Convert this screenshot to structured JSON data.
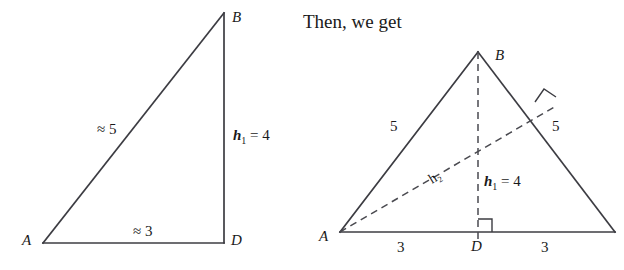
{
  "canvas": {
    "width": 624,
    "height": 270,
    "background": "#ffffff"
  },
  "colors": {
    "stroke": "#3c3c42",
    "dashed_stroke": "#4a4a50",
    "text": "#1a1a1a"
  },
  "prose": {
    "connector_text": "Then, we get"
  },
  "left_figure": {
    "name": "right-triangle-ABD",
    "vertices": {
      "A": {
        "label": "A",
        "x": 43,
        "y": 243
      },
      "B": {
        "label": "B",
        "x": 224,
        "y": 13
      },
      "D": {
        "label": "D",
        "x": 224,
        "y": 243
      }
    },
    "vertex_labels": {
      "A": {
        "text": "A",
        "x": 22,
        "y": 245
      },
      "B": {
        "text": "B",
        "x": 232,
        "y": 22
      },
      "D": {
        "text": "D",
        "x": 231,
        "y": 245
      }
    },
    "side_labels": [
      {
        "name": "hypotenuse-label",
        "text": "≈ 5",
        "x": 97,
        "y": 134
      },
      {
        "name": "base-label",
        "text": "≈ 3",
        "x": 133,
        "y": 236
      }
    ],
    "height_label": {
      "name": "h1-label",
      "var": "h",
      "sub": "1",
      "equals": " = 4",
      "x": 233,
      "y": 140
    }
  },
  "right_figure": {
    "name": "isosceles-triangle-ABC",
    "vertices": {
      "A": {
        "label": "A",
        "x": 340,
        "y": 232
      },
      "B": {
        "label": "B",
        "x": 478,
        "y": 52
      },
      "C": {
        "label": "",
        "x": 615,
        "y": 232
      },
      "D": {
        "label": "D",
        "x": 478,
        "y": 232
      },
      "E": {
        "label": "",
        "x": 548,
        "y": 113
      }
    },
    "vertex_labels": {
      "A": {
        "text": "A",
        "x": 321,
        "y": 240
      },
      "B": {
        "text": "B",
        "x": 496,
        "y": 60
      },
      "D": {
        "text": "D",
        "x": 472,
        "y": 249
      }
    },
    "side_labels": [
      {
        "name": "left-side-label",
        "text": "5",
        "x": 392,
        "y": 131
      },
      {
        "name": "right-side-label",
        "text": "5",
        "x": 553,
        "y": 131
      },
      {
        "name": "base-left-label",
        "text": "3",
        "x": 399,
        "y": 250
      },
      {
        "name": "base-right-label",
        "text": "3",
        "x": 543,
        "y": 250
      }
    ],
    "height_labels": {
      "h1": {
        "var": "h",
        "sub": "1",
        "equals": " = 4",
        "x": 483,
        "y": 184
      },
      "h2": {
        "text": "h₂",
        "x": 435,
        "y": 180,
        "rotation": -38
      }
    },
    "right_angle_marks": [
      {
        "name": "right-angle-at-D",
        "x": 478,
        "y": 232,
        "size": 13,
        "orientation": "base"
      },
      {
        "name": "right-angle-at-foot-h2",
        "x": 548,
        "y": 113,
        "size": 11,
        "orientation": "slanted"
      }
    ]
  }
}
